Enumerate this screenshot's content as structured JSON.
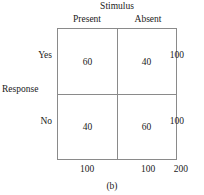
{
  "figure": {
    "caption": "(b)",
    "column_group_title": "Stimulus",
    "row_group_title": "Response",
    "column_headers": [
      "Present",
      "Absent"
    ],
    "row_headers": [
      "Yes",
      "No"
    ],
    "cells": {
      "yes_present": "60",
      "yes_absent": "40",
      "no_present": "40",
      "no_absent": "60"
    },
    "row_totals": [
      "100",
      "100"
    ],
    "column_totals": [
      "100",
      "100"
    ],
    "grand_total": "200"
  },
  "chart_data": {
    "type": "table",
    "title": "(b)",
    "xlabel": "Stimulus",
    "ylabel": "Response",
    "categories": [
      "Present",
      "Absent"
    ],
    "row_categories": [
      "Yes",
      "No"
    ],
    "series": [
      {
        "name": "Yes",
        "values": [
          60,
          40
        ]
      },
      {
        "name": "No",
        "values": [
          40,
          60
        ]
      }
    ],
    "row_totals": [
      100,
      100
    ],
    "column_totals": [
      100,
      100
    ],
    "grand_total": 200,
    "grid": true,
    "legend": "none"
  }
}
